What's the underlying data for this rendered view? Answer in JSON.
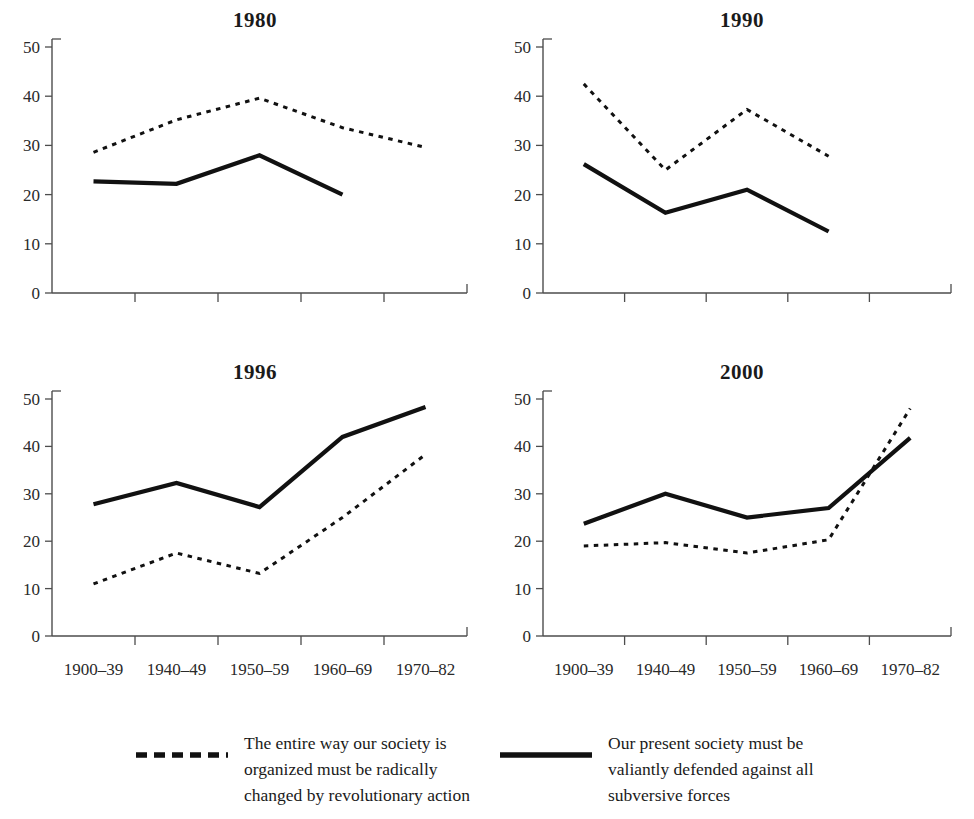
{
  "figure": {
    "background_color": "#ffffff",
    "ink_color": "#111111",
    "axis_color": "#4d4d4d"
  },
  "panels": [
    {
      "title": "1980"
    },
    {
      "title": "1990"
    },
    {
      "title": "1996"
    },
    {
      "title": "2000"
    }
  ],
  "axis": {
    "y_ticks": [
      "0",
      "10",
      "20",
      "30",
      "40",
      "50"
    ],
    "x_categories": [
      "1900–39",
      "1940–49",
      "1950–59",
      "1960–69",
      "1970–82"
    ]
  },
  "legend": {
    "entries": [
      {
        "key": "dashed",
        "lines": [
          "The entire way our society is",
          "organized must be radically",
          "changed by revolutionary action"
        ],
        "full_text": "The entire way our society is organized must be radically changed by revolutionary action"
      },
      {
        "key": "solid",
        "lines": [
          "Our present society must be",
          "valiantly defended against all",
          "subversive forces"
        ],
        "full_text": "Our present society must be valiantly defended against all subversive forces"
      }
    ]
  },
  "chart_data": [
    {
      "type": "line",
      "title": "1980",
      "xlabel": "",
      "ylabel": "",
      "ylim": [
        0,
        50
      ],
      "yticks": [
        0,
        10,
        20,
        30,
        40,
        50
      ],
      "grid": false,
      "legend_position": "bottom",
      "categories": [
        "1900–39",
        "1940–49",
        "1950–59",
        "1960–69",
        "1970–82"
      ],
      "series": [
        {
          "name": "The entire way our society is organized must be radically changed by revolutionary action",
          "style": "dashed",
          "values": [
            28.6,
            35.2,
            39.6,
            33.6,
            29.6
          ]
        },
        {
          "name": "Our present society must be valiantly defended against all subversive forces",
          "style": "solid",
          "values": [
            22.7,
            22.2,
            28.0,
            20.0,
            null
          ]
        }
      ]
    },
    {
      "type": "line",
      "title": "1990",
      "xlabel": "",
      "ylabel": "",
      "ylim": [
        0,
        50
      ],
      "yticks": [
        0,
        10,
        20,
        30,
        40,
        50
      ],
      "grid": false,
      "legend_position": "bottom",
      "categories": [
        "1900–39",
        "1940–49",
        "1950–59",
        "1960–69",
        "1970–82"
      ],
      "series": [
        {
          "name": "The entire way our society is organized must be radically changed by revolutionary action",
          "style": "dashed",
          "values": [
            42.5,
            25.0,
            37.3,
            27.8,
            null
          ]
        },
        {
          "name": "Our present society must be valiantly defended against all subversive forces",
          "style": "solid",
          "values": [
            26.2,
            16.3,
            21.0,
            12.5,
            null
          ]
        }
      ]
    },
    {
      "type": "line",
      "title": "1996",
      "xlabel": "",
      "ylabel": "",
      "ylim": [
        0,
        50
      ],
      "yticks": [
        0,
        10,
        20,
        30,
        40,
        50
      ],
      "grid": false,
      "legend_position": "bottom",
      "categories": [
        "1900–39",
        "1940–49",
        "1950–59",
        "1960–69",
        "1970–82"
      ],
      "series": [
        {
          "name": "The entire way our society is organized must be radically changed by revolutionary action",
          "style": "dashed",
          "values": [
            11.0,
            17.5,
            13.2,
            25.0,
            38.3
          ]
        },
        {
          "name": "Our present society must be valiantly defended against all subversive forces",
          "style": "solid",
          "values": [
            27.8,
            32.3,
            27.2,
            42.0,
            48.3
          ]
        }
      ]
    },
    {
      "type": "line",
      "title": "2000",
      "xlabel": "",
      "ylabel": "",
      "ylim": [
        0,
        50
      ],
      "yticks": [
        0,
        10,
        20,
        30,
        40,
        50
      ],
      "grid": false,
      "legend_position": "bottom",
      "categories": [
        "1900–39",
        "1940–49",
        "1950–59",
        "1960–69",
        "1970–82"
      ],
      "series": [
        {
          "name": "The entire way our society is organized must be radically changed by revolutionary action",
          "style": "dashed",
          "values": [
            19.0,
            19.7,
            17.5,
            20.3,
            48.0
          ]
        },
        {
          "name": "Our present society must be valiantly defended against all subversive forces",
          "style": "solid",
          "values": [
            23.7,
            30.0,
            25.0,
            27.0,
            41.8
          ]
        }
      ]
    }
  ]
}
